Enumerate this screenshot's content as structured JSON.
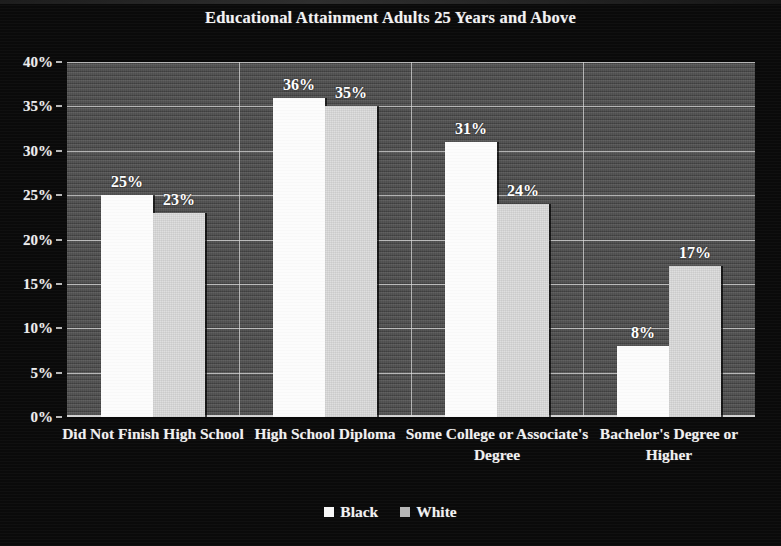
{
  "chart_data": {
    "type": "bar",
    "title": "Educational Attainment Adults 25 Years and Above",
    "xlabel": "",
    "ylabel": "",
    "categories": [
      "Did Not Finish High School",
      "High School Diploma",
      "Some College or Associate's Degree",
      "Bachelor's Degree or Higher"
    ],
    "series": [
      {
        "name": "Black",
        "values": [
          25,
          36,
          31,
          8
        ],
        "color": "#fcfcfc"
      },
      {
        "name": "White",
        "values": [
          23,
          35,
          24,
          17
        ],
        "color": "#dcdcdc"
      }
    ],
    "data_labels": [
      [
        "25%",
        "23%"
      ],
      [
        "36%",
        "35%"
      ],
      [
        "31%",
        "24%"
      ],
      [
        "8%",
        "17%"
      ]
    ],
    "ylim": [
      0,
      40
    ],
    "ytick_values": [
      0,
      5,
      10,
      15,
      20,
      25,
      30,
      35,
      40
    ],
    "ytick_labels": [
      "0%",
      "5%",
      "10%",
      "15%",
      "20%",
      "25%",
      "30%",
      "35%",
      "40%"
    ],
    "grid": true,
    "legend_position": "bottom",
    "plot_background": "#4a4a4a",
    "figure_background": "#0a0a0a",
    "text_color": "#f2f2f2"
  },
  "legend": {
    "items": [
      {
        "label": "Black",
        "swatch": "legend-swatch-black"
      },
      {
        "label": "White",
        "swatch": "legend-swatch-white"
      }
    ]
  },
  "x_axis": {
    "labels": [
      "Did Not Finish High School",
      "High School Diploma",
      "Some College or Associate's Degree",
      "Bachelor's Degree or Higher"
    ]
  }
}
